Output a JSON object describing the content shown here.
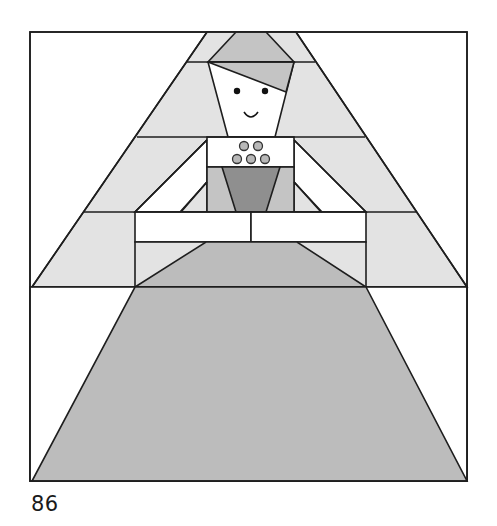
{
  "figure": {
    "page_number": "86",
    "colors": {
      "background": "#ffffff",
      "light_gray": "#e3e3e3",
      "medium_gray": "#c4c4c4",
      "dark_gray": "#8f8f8f",
      "skirt_gray": "#bcbcbc",
      "outline": "#1e1e1e",
      "eye": "#111111"
    },
    "frame": {
      "x": 30,
      "y": 32,
      "width": 437,
      "height": 449
    },
    "band_lines_y": [
      62,
      137,
      212,
      287
    ],
    "parts": [
      "outer-triangle-background",
      "hat",
      "hat-band",
      "face",
      "eyes",
      "smile",
      "collar-with-buttons",
      "bodice",
      "bodice-v-panel",
      "arms",
      "sleeve-triangles",
      "upper-skirt",
      "lower-skirt"
    ],
    "buttons_count": 5
  }
}
